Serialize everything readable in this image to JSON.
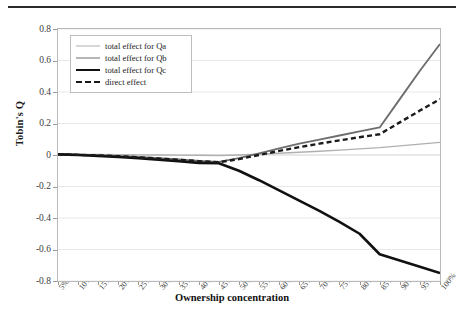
{
  "figure": {
    "background": "#ffffff",
    "frame_color": "#b9b9b9"
  },
  "chart_data": {
    "type": "line",
    "title": "",
    "xlabel": "Ownership concentration",
    "ylabel": "Tobin's Q",
    "grid": true,
    "legend_position": "top-left",
    "ylim": [
      -0.8,
      0.8
    ],
    "ytick_labels": [
      "0.8",
      "0.6",
      "0.4",
      "0.2",
      "0",
      "-0.2",
      "-0.4",
      "-0.6",
      "-0.8"
    ],
    "ytick_values": [
      0.8,
      0.6,
      0.4,
      0.2,
      0,
      -0.2,
      -0.4,
      -0.6,
      -0.8
    ],
    "categories": [
      "5%",
      "10%",
      "15%",
      "20%",
      "25%",
      "30%",
      "35%",
      "40%",
      "45%",
      "50%",
      "55%",
      "60%",
      "65%",
      "70%",
      "75%",
      "80%",
      "85%",
      "90%",
      "95%",
      "100%"
    ],
    "series": [
      {
        "name": "total effect for Qa",
        "color": "#b0b0b0",
        "width": 1.4,
        "dash": "none",
        "values": [
          0.005,
          0.004,
          0.003,
          0.002,
          0.001,
          0.0,
          -0.001,
          -0.002,
          -0.003,
          0.0,
          0.005,
          0.011,
          0.017,
          0.024,
          0.031,
          0.039,
          0.047,
          0.058,
          0.069,
          0.08
        ]
      },
      {
        "name": "total effect for Qb",
        "color": "#6e6e6e",
        "width": 1.9,
        "dash": "none",
        "values": [
          0.005,
          0.002,
          -0.002,
          -0.007,
          -0.013,
          -0.02,
          -0.028,
          -0.037,
          -0.044,
          -0.02,
          0.01,
          0.042,
          0.072,
          0.098,
          0.124,
          0.15,
          0.175,
          0.355,
          0.535,
          0.705
        ]
      },
      {
        "name": "total effect for Qc",
        "color": "#111111",
        "width": 2.6,
        "dash": "none",
        "values": [
          0.004,
          0.0,
          -0.006,
          -0.013,
          -0.021,
          -0.03,
          -0.04,
          -0.05,
          -0.052,
          -0.1,
          -0.16,
          -0.225,
          -0.29,
          -0.355,
          -0.425,
          -0.5,
          -0.63,
          -0.67,
          -0.71,
          -0.75
        ]
      },
      {
        "name": "direct effect",
        "color": "#1a1a1a",
        "width": 2.4,
        "dash": "dashed",
        "values": [
          0.004,
          0.001,
          -0.003,
          -0.008,
          -0.015,
          -0.022,
          -0.03,
          -0.039,
          -0.046,
          -0.026,
          0.0,
          0.026,
          0.05,
          0.072,
          0.093,
          0.113,
          0.132,
          0.207,
          0.282,
          0.355
        ]
      }
    ]
  },
  "legend": {
    "items": [
      {
        "label": "total effect for Qa",
        "style": "solid-light"
      },
      {
        "label": "total effect for Qb",
        "style": "solid-medium"
      },
      {
        "label": "total effect for Qc",
        "style": "solid-heavy"
      },
      {
        "label": "direct effect",
        "style": "dashed"
      }
    ]
  }
}
